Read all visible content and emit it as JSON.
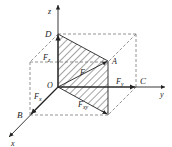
{
  "diagram": {
    "type": "3D force decomposition",
    "axes": {
      "x": "x",
      "y": "y",
      "z": "z"
    },
    "points": {
      "origin": "O",
      "A": "A",
      "B": "B",
      "C": "C",
      "D": "D"
    },
    "forces": {
      "F": {
        "main": "F",
        "sub": ""
      },
      "Fx": {
        "main": "F",
        "sub": "x"
      },
      "Fy": {
        "main": "F",
        "sub": "y"
      },
      "Fz": {
        "main": "F",
        "sub": "z"
      },
      "Fxy": {
        "main": "F",
        "sub": "xy"
      }
    },
    "colors": {
      "line": "#222222",
      "dashed": "#777777",
      "hatch": "#333333"
    }
  }
}
